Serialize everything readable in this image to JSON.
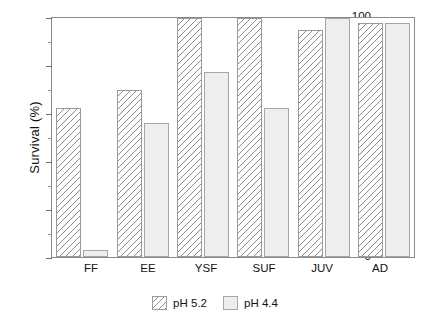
{
  "chart_data": {
    "type": "bar",
    "title": "",
    "xlabel": "",
    "ylabel": "Survival (%)",
    "categories": [
      "FF",
      "EE",
      "YSF",
      "SUF",
      "JUV",
      "AD"
    ],
    "series": [
      {
        "name": "pH 5.2",
        "values": [
          62.5,
          70,
          100,
          100,
          95,
          98
        ]
      },
      {
        "name": "pH 4.4",
        "values": [
          3,
          56,
          77.5,
          62.5,
          100,
          98
        ]
      }
    ],
    "ylim": [
      0,
      100
    ],
    "yticks": [
      0,
      20,
      40,
      60,
      80,
      100
    ],
    "ytick_labels": [
      "0",
      "20",
      "40",
      "60",
      "80",
      "100"
    ],
    "yminor_ticks": [
      10,
      30,
      50,
      70,
      90
    ],
    "grid": false,
    "legend_position": "bottom-center",
    "colors": {
      "series_1_fill": "#ffffff",
      "series_1_hatch": "#8d8d8d",
      "series_2_fill": "#eeeeee",
      "axis": "#8a8a8a",
      "text": "#111111"
    }
  },
  "axis": {
    "y_title": "Survival (%)",
    "y_tick_labels": [
      "100",
      "80",
      "60",
      "40",
      "20",
      "0"
    ],
    "x_tick_labels": [
      "FF",
      "EE",
      "YSF",
      "SUF",
      "JUV",
      "AD"
    ]
  },
  "legend": {
    "entries": [
      {
        "label": "pH 5.2",
        "pattern": "hatched"
      },
      {
        "label": "pH 4.4",
        "pattern": "solid-light-gray"
      }
    ]
  }
}
